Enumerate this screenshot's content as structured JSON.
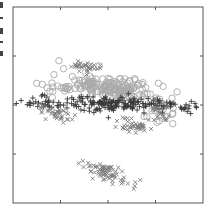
{
  "chart_data": {
    "type": "scatter",
    "title": "",
    "xlabel": "",
    "ylabel": "",
    "grid": false,
    "legend_position": "cropped-left",
    "frame": {
      "left": 13,
      "top": 7,
      "right": 203,
      "bottom": 203
    },
    "xlim": [
      0,
      4
    ],
    "ylim": [
      0,
      4
    ],
    "x_ticks": [
      1,
      2,
      3
    ],
    "y_ticks": [
      1,
      2,
      3
    ],
    "tick_labels_visible": false,
    "series": [
      {
        "name": "circles",
        "marker": "circle",
        "color": "#a9a9a9",
        "clusters": [
          {
            "cx": 2.1,
            "cy": 2.35,
            "sx": 0.55,
            "sy": 0.12,
            "n": 170,
            "tilt": -0.18
          },
          {
            "cx": 1.0,
            "cy": 2.35,
            "sx": 0.25,
            "sy": 0.08,
            "n": 20,
            "tilt": 0
          },
          {
            "cx": 3.1,
            "cy": 1.85,
            "sx": 0.15,
            "sy": 0.12,
            "n": 18,
            "tilt": 0
          }
        ]
      },
      {
        "name": "plus",
        "marker": "plus",
        "color": "#3a3a3a",
        "clusters": [
          {
            "cx": 2.2,
            "cy": 2.02,
            "sx": 0.85,
            "sy": 0.07,
            "n": 190,
            "tilt": -0.02
          },
          {
            "cx": 0.6,
            "cy": 2.0,
            "sx": 0.3,
            "sy": 0.06,
            "n": 15,
            "tilt": 0
          },
          {
            "cx": 3.65,
            "cy": 1.95,
            "sx": 0.12,
            "sy": 0.04,
            "n": 8,
            "tilt": 0
          }
        ]
      },
      {
        "name": "crosses",
        "marker": "x",
        "color": "#7e7e7e",
        "clusters": [
          {
            "cx": 1.55,
            "cy": 2.78,
            "sx": 0.14,
            "sy": 0.05,
            "n": 35,
            "tilt": 0
          },
          {
            "cx": 0.9,
            "cy": 1.82,
            "sx": 0.22,
            "sy": 0.08,
            "n": 40,
            "tilt": -0.3
          },
          {
            "cx": 2.55,
            "cy": 1.55,
            "sx": 0.16,
            "sy": 0.05,
            "n": 40,
            "tilt": 0
          },
          {
            "cx": 2.0,
            "cy": 0.62,
            "sx": 0.25,
            "sy": 0.09,
            "n": 75,
            "tilt": -0.35
          },
          {
            "cx": 3.1,
            "cy": 1.8,
            "sx": 0.12,
            "sy": 0.12,
            "n": 20,
            "tilt": 0
          },
          {
            "cx": 2.35,
            "cy": 1.75,
            "sx": 0.1,
            "sy": 0.04,
            "n": 6,
            "tilt": 0
          }
        ]
      }
    ]
  }
}
